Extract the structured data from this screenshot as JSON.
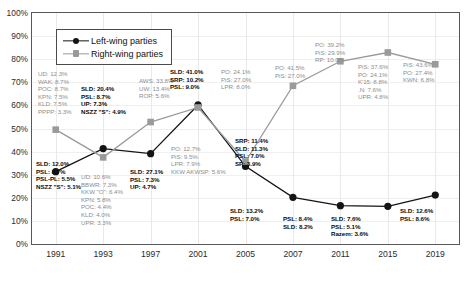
{
  "legend": {
    "items": [
      {
        "label": "Left-wing parties",
        "marker": "circle-marker-icon",
        "color": "#141414"
      },
      {
        "label": "Right-wing parties",
        "marker": "square-marker-icon",
        "color": "#9a9a9a"
      }
    ]
  },
  "chart_data": {
    "type": "line",
    "title": "",
    "xlabel": "",
    "ylabel": "",
    "x": [
      "1991",
      "1993",
      "1997",
      "2001",
      "2005",
      "2007",
      "2011",
      "2015",
      "2019"
    ],
    "ylim": [
      0,
      100
    ],
    "yticks": [
      "0%",
      "10%",
      "20%",
      "30%",
      "40%",
      "50%",
      "60%",
      "70%",
      "80%",
      "90%",
      "100%"
    ],
    "ytick_values": [
      0,
      10,
      20,
      30,
      40,
      50,
      60,
      70,
      80,
      90,
      100
    ],
    "grid": true,
    "legend_position": "top-left",
    "series": [
      {
        "name": "Left-wing parties",
        "color": "#141414",
        "marker": "circle",
        "values": [
          31.3,
          41.3,
          39.1,
          60.2,
          33.6,
          20.2,
          16.6,
          16.3,
          21.2
        ]
      },
      {
        "name": "Right-wing parties",
        "color": "#9a9a9a",
        "marker": "square",
        "values": [
          49.5,
          37.5,
          52.8,
          59.1,
          35.7,
          68.5,
          79.1,
          82.9,
          77.8
        ]
      }
    ]
  },
  "annotations": {
    "1991": {
      "right": [
        "UD: 12.3%",
        "WAK: 8.7%",
        "POC: 8.7%",
        "KPN: 7.5%",
        "KLD: 7.5%",
        "PPPP: 3.3%"
      ],
      "left": [
        "SLD: 12.0%",
        "PSL: 8.7%",
        "PSL-PL: 5.5%",
        "NSZZ \"S\": 5.1%"
      ]
    },
    "1993": {
      "left": [
        "SLD: 20.4%",
        "PSL: 8.7%",
        "UP: 7.3%",
        "NSZZ \"S\": 4.9%"
      ],
      "right": [
        "UD: 10.6%",
        "BBWR: 7.3%",
        "KKW \"O\": 6.4%",
        "KPN: 5.8%",
        "POC: 4.4%",
        "KLD: 4.0%",
        "UPR: 3.3%"
      ]
    },
    "1997": {
      "right": [
        "AWS: 33.8%",
        "UW: 13.4%",
        "ROP: 5.6%"
      ],
      "left": [
        "SLD: 27.1%",
        "PSL: 7.3%",
        "UP: 4.7%"
      ]
    },
    "2001": {
      "left": [
        "SLD: 41.0%",
        "SRP: 10.2%",
        "PSL: 9.0%"
      ],
      "right": [
        "PO: 24.1%",
        "PiS: 27.0%",
        "LPR: 8.0%"
      ]
    },
    "2005": {
      "right": [
        "PO: 12.7%",
        "PiS: 9.5%",
        "LPR: 7.9%",
        "KKW AKWSP: 5.6%"
      ],
      "left": [
        "SRP: 11.4%",
        "SLD: 11.3%",
        "PSL: 7.0%",
        "SP: 3.9%"
      ]
    },
    "2007": {
      "right": [
        "PO: 41.5%",
        "PiS: 27.0%"
      ],
      "left": [
        "SLD: 13.2%",
        "PSL: 7.0%"
      ]
    },
    "2011": {
      "right": [
        "PO: 39.2%",
        "PiS: 29.9%",
        "RP: 10.0%"
      ],
      "left": [
        "PSL: 8.4%",
        "SLD: 8.2%"
      ]
    },
    "2015": {
      "right": [
        "PiS: 37.6%",
        "PO: 24.1%",
        "K'15: 8.8%",
        ".N: 7.6%",
        "UPR: 4.8%"
      ],
      "left": [
        "SLD: 7.6%",
        "PSL: 5.1%",
        "Razem: 3.6%"
      ]
    },
    "2019": {
      "right": [
        "PiS: 43.6%",
        "PO: 27.4%",
        "KWN: 6.8%"
      ],
      "left": [
        "SLD: 12.6%",
        "PSL: 8.6%"
      ]
    }
  }
}
